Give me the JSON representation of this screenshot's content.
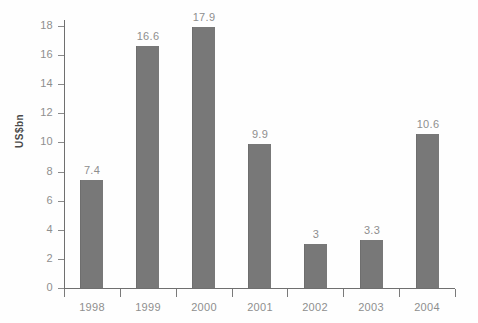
{
  "chart_data": {
    "type": "bar",
    "title": "",
    "subtitle": "",
    "xlabel": "",
    "ylabel": "US$bn",
    "categories": [
      "1998",
      "1999",
      "2000",
      "2001",
      "2002",
      "2003",
      "2004"
    ],
    "values": [
      7.4,
      16.6,
      17.9,
      9.9,
      3,
      3.3,
      10.6
    ],
    "data_labels": [
      "7.4",
      "16.6",
      "17.9",
      "9.9",
      "3",
      "3.3",
      "10.6"
    ],
    "ylim": [
      0,
      18
    ],
    "ytick_labels": [
      "0",
      "2",
      "4",
      "6",
      "8",
      "10",
      "12",
      "14",
      "16",
      "18"
    ],
    "ytick_values": [
      0,
      2,
      4,
      6,
      8,
      10,
      12,
      14,
      16,
      18
    ],
    "grid": false,
    "legend": false,
    "legend_position": "none",
    "series": [
      {
        "name": "",
        "values": [
          7.4,
          16.6,
          17.9,
          9.9,
          3,
          3.3,
          10.6
        ]
      }
    ]
  },
  "style": {
    "bar_color": "#787878",
    "bar_edge_color": "#6e6e6e",
    "axis_color": "#6f6f6f",
    "tick_color": "#8a8a8a",
    "label_color": "#8e8e8e",
    "axis_title_color": "#4a4a4a",
    "background": "#fefefe"
  }
}
